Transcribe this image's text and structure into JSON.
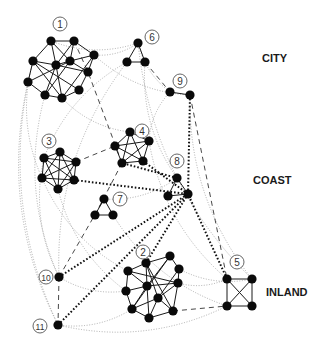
{
  "regions": [
    {
      "label": "CITY",
      "x": 262,
      "y": 52
    },
    {
      "label": "COAST",
      "x": 253,
      "y": 174
    },
    {
      "label": "INLAND",
      "x": 266,
      "y": 286
    }
  ],
  "communities": [
    {
      "id": "1",
      "label_x": 60,
      "label_y": 24,
      "nodes": [
        [
          51,
          41
        ],
        [
          74,
          41
        ],
        [
          33,
          61
        ],
        [
          56,
          65
        ],
        [
          70,
          61
        ],
        [
          94,
          55
        ],
        [
          88,
          72
        ],
        [
          28,
          82
        ],
        [
          79,
          90
        ],
        [
          45,
          95
        ],
        [
          62,
          98
        ]
      ],
      "edges": [
        [
          0,
          1
        ],
        [
          0,
          2
        ],
        [
          0,
          3
        ],
        [
          0,
          4
        ],
        [
          1,
          4
        ],
        [
          1,
          5
        ],
        [
          1,
          3
        ],
        [
          2,
          3
        ],
        [
          2,
          7
        ],
        [
          2,
          8
        ],
        [
          3,
          4
        ],
        [
          3,
          9
        ],
        [
          3,
          10
        ],
        [
          3,
          6
        ],
        [
          4,
          6
        ],
        [
          4,
          5
        ],
        [
          4,
          9
        ],
        [
          5,
          6
        ],
        [
          6,
          8
        ],
        [
          7,
          9
        ],
        [
          7,
          4
        ],
        [
          8,
          10
        ],
        [
          9,
          10
        ],
        [
          2,
          10
        ],
        [
          5,
          10
        ]
      ]
    },
    {
      "id": "2",
      "label_x": 143,
      "label_y": 252,
      "nodes": [
        [
          146,
          263
        ],
        [
          170,
          256
        ],
        [
          128,
          271
        ],
        [
          179,
          269
        ],
        [
          147,
          286
        ],
        [
          178,
          283
        ],
        [
          126,
          291
        ],
        [
          158,
          298
        ],
        [
          132,
          309
        ],
        [
          173,
          311
        ],
        [
          149,
          318
        ]
      ],
      "edges": [
        [
          0,
          1
        ],
        [
          0,
          2
        ],
        [
          0,
          4
        ],
        [
          0,
          7
        ],
        [
          0,
          9
        ],
        [
          1,
          3
        ],
        [
          1,
          4
        ],
        [
          1,
          8
        ],
        [
          2,
          4
        ],
        [
          2,
          6
        ],
        [
          3,
          5
        ],
        [
          3,
          7
        ],
        [
          4,
          5
        ],
        [
          4,
          6
        ],
        [
          4,
          8
        ],
        [
          4,
          10
        ],
        [
          5,
          7
        ],
        [
          5,
          9
        ],
        [
          6,
          8
        ],
        [
          7,
          9
        ],
        [
          7,
          10
        ],
        [
          8,
          10
        ],
        [
          9,
          10
        ],
        [
          7,
          8
        ],
        [
          2,
          5
        ]
      ]
    },
    {
      "id": "3",
      "label_x": 49,
      "label_y": 141,
      "nodes": [
        [
          60,
          152
        ],
        [
          44,
          158
        ],
        [
          76,
          162
        ],
        [
          42,
          178
        ],
        [
          74,
          180
        ],
        [
          58,
          189
        ]
      ],
      "edges": [
        [
          0,
          1
        ],
        [
          0,
          2
        ],
        [
          0,
          3
        ],
        [
          0,
          4
        ],
        [
          0,
          5
        ],
        [
          1,
          2
        ],
        [
          1,
          3
        ],
        [
          1,
          4
        ],
        [
          1,
          5
        ],
        [
          2,
          3
        ],
        [
          2,
          4
        ],
        [
          2,
          5
        ],
        [
          3,
          4
        ],
        [
          3,
          5
        ],
        [
          4,
          5
        ]
      ]
    },
    {
      "id": "4",
      "label_x": 142,
      "label_y": 131,
      "nodes": [
        [
          130,
          132
        ],
        [
          115,
          146
        ],
        [
          149,
          141
        ],
        [
          122,
          163
        ],
        [
          143,
          161
        ]
      ],
      "edges": [
        [
          0,
          1
        ],
        [
          0,
          2
        ],
        [
          0,
          3
        ],
        [
          0,
          4
        ],
        [
          1,
          2
        ],
        [
          1,
          3
        ],
        [
          1,
          4
        ],
        [
          2,
          3
        ],
        [
          2,
          4
        ],
        [
          3,
          4
        ]
      ]
    },
    {
      "id": "5",
      "label_x": 237,
      "label_y": 262,
      "nodes": [
        [
          227,
          279
        ],
        [
          252,
          279
        ],
        [
          227,
          306
        ],
        [
          252,
          306
        ]
      ],
      "edges": [
        [
          0,
          1
        ],
        [
          0,
          2
        ],
        [
          0,
          3
        ],
        [
          1,
          2
        ],
        [
          1,
          3
        ],
        [
          2,
          3
        ]
      ]
    },
    {
      "id": "6",
      "label_x": 152,
      "label_y": 37,
      "nodes": [
        [
          138,
          43
        ],
        [
          127,
          62
        ],
        [
          145,
          62
        ]
      ],
      "edges": [
        [
          0,
          1
        ],
        [
          0,
          2
        ],
        [
          1,
          2
        ]
      ]
    },
    {
      "id": "7",
      "label_x": 120,
      "label_y": 199,
      "nodes": [
        [
          104,
          199
        ],
        [
          95,
          215
        ],
        [
          113,
          215
        ]
      ],
      "edges": [
        [
          0,
          1
        ],
        [
          0,
          2
        ],
        [
          1,
          2
        ]
      ]
    },
    {
      "id": "8",
      "label_x": 177,
      "label_y": 161,
      "nodes": [
        [
          177,
          178
        ],
        [
          168,
          196
        ],
        [
          188,
          194
        ]
      ],
      "edges": [
        [
          0,
          1
        ],
        [
          0,
          2
        ],
        [
          1,
          2
        ]
      ]
    },
    {
      "id": "9",
      "label_x": 180,
      "label_y": 81,
      "nodes": [
        [
          170,
          92
        ],
        [
          190,
          95
        ]
      ],
      "edges": [
        [
          0,
          1
        ]
      ]
    },
    {
      "id": "10",
      "label_x": 46,
      "label_y": 277,
      "nodes": [
        [
          59,
          277
        ]
      ],
      "edges": []
    },
    {
      "id": "11",
      "label_x": 40,
      "label_y": 326,
      "nodes": [
        [
          58,
          325
        ]
      ],
      "edges": []
    }
  ],
  "inter_links": {
    "dashed": [
      [
        [
          74,
          41
        ],
        [
          88,
          72
        ],
        [
          122,
          163
        ]
      ],
      [
        [
          145,
          62
        ],
        [
          170,
          92
        ]
      ],
      [
        [
          76,
          162
        ],
        [
          115,
          146
        ]
      ],
      [
        [
          190,
          95
        ],
        [
          227,
          279
        ]
      ],
      [
        [
          122,
          163
        ],
        [
          95,
          215
        ]
      ],
      [
        [
          59,
          277
        ],
        [
          58,
          325
        ]
      ],
      [
        [
          59,
          277
        ],
        [
          104,
          199
        ]
      ],
      [
        [
          173,
          311
        ],
        [
          227,
          306
        ]
      ]
    ],
    "dotted_bold": [
      [
        [
          74,
          180
        ],
        [
          188,
          194
        ]
      ],
      [
        [
          143,
          161
        ],
        [
          188,
          194
        ]
      ],
      [
        [
          59,
          277
        ],
        [
          188,
          194
        ]
      ],
      [
        [
          58,
          325
        ],
        [
          188,
          194
        ]
      ],
      [
        [
          146,
          263
        ],
        [
          188,
          194
        ]
      ],
      [
        [
          227,
          279
        ],
        [
          188,
          194
        ]
      ],
      [
        [
          190,
          95
        ],
        [
          188,
          194
        ]
      ],
      [
        [
          177,
          178
        ],
        [
          122,
          163
        ]
      ]
    ],
    "dotted_light": [
      [
        [
          51,
          41
        ],
        [
          138,
          43
        ]
      ],
      [
        [
          94,
          55
        ],
        [
          138,
          43
        ]
      ],
      [
        [
          138,
          43
        ],
        [
          170,
          92
        ]
      ],
      [
        [
          138,
          43
        ],
        [
          252,
          279
        ]
      ],
      [
        [
          33,
          61
        ],
        [
          42,
          178
        ]
      ],
      [
        [
          28,
          82
        ],
        [
          58,
          325
        ]
      ],
      [
        [
          45,
          95
        ],
        [
          59,
          277
        ]
      ],
      [
        [
          62,
          98
        ],
        [
          130,
          132
        ]
      ],
      [
        [
          94,
          55
        ],
        [
          190,
          95
        ]
      ],
      [
        [
          127,
          62
        ],
        [
          59,
          277
        ]
      ],
      [
        [
          127,
          62
        ],
        [
          44,
          158
        ]
      ],
      [
        [
          145,
          62
        ],
        [
          177,
          178
        ]
      ],
      [
        [
          170,
          92
        ],
        [
          149,
          141
        ]
      ],
      [
        [
          190,
          95
        ],
        [
          252,
          279
        ]
      ],
      [
        [
          44,
          158
        ],
        [
          59,
          277
        ]
      ],
      [
        [
          58,
          189
        ],
        [
          126,
          291
        ]
      ],
      [
        [
          104,
          199
        ],
        [
          177,
          178
        ]
      ],
      [
        [
          113,
          215
        ],
        [
          227,
          306
        ]
      ],
      [
        [
          59,
          277
        ],
        [
          126,
          291
        ]
      ],
      [
        [
          58,
          325
        ],
        [
          132,
          309
        ]
      ],
      [
        [
          58,
          325
        ],
        [
          227,
          306
        ]
      ],
      [
        [
          178,
          283
        ],
        [
          227,
          279
        ]
      ],
      [
        [
          179,
          269
        ],
        [
          252,
          279
        ]
      ],
      [
        [
          149,
          141
        ],
        [
          227,
          279
        ]
      ],
      [
        [
          42,
          178
        ],
        [
          128,
          271
        ]
      ],
      [
        [
          33,
          61
        ],
        [
          58,
          325
        ]
      ]
    ]
  },
  "colors": {
    "node": "#0a0a0a",
    "edge": "#1a1a1a",
    "dotted_light": "#9a9a9a",
    "label_ring": "#555555"
  }
}
